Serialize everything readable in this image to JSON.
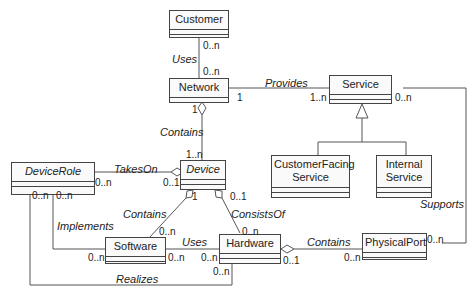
{
  "classes": {
    "customer": {
      "name": "Customer",
      "abstract": false
    },
    "network": {
      "name": "Network",
      "abstract": false
    },
    "service": {
      "name": "Service",
      "abstract": false
    },
    "customer_facing_service": {
      "name": "CustomerFacing Service",
      "line1": "CustomerFacing",
      "line2": "Service",
      "abstract": false
    },
    "internal_service": {
      "name": "Internal Service",
      "line1": "Internal",
      "line2": "Service",
      "abstract": false
    },
    "device_role": {
      "name": "DeviceRole",
      "abstract": true
    },
    "device": {
      "name": "Device",
      "abstract": true
    },
    "software": {
      "name": "Software",
      "abstract": false
    },
    "hardware": {
      "name": "Hardware",
      "abstract": false
    },
    "physical_port": {
      "name": "PhysicalPort",
      "abstract": false
    }
  },
  "associations": {
    "uses_customer_network": {
      "label": "Uses",
      "from_mult": "0..n",
      "to_mult": "0..n"
    },
    "provides": {
      "label": "Provides",
      "network_mult": "1",
      "service_mult": "1..n"
    },
    "contains_network_device": {
      "label": "Contains",
      "network_mult": "1",
      "device_mult": "1..n"
    },
    "takes_on": {
      "label": "TakesOn",
      "role_mult": "0..n",
      "device_mult": "0..1"
    },
    "contains_device_software": {
      "label": "Contains",
      "device_mult": "1",
      "software_mult": "0..n"
    },
    "consists_of": {
      "label": "ConsistsOf",
      "device_mult": "0..1",
      "hardware_mult": "0..n"
    },
    "implements": {
      "label": "Implements",
      "role_mult": "0..n",
      "software_mult": "0..n"
    },
    "uses_software_hardware": {
      "label": "Uses",
      "software_mult": "0..n",
      "hardware_mult": "0..n"
    },
    "contains_hardware_port": {
      "label": "Contains",
      "hardware_mult": "0..1",
      "port_mult": "0..n"
    },
    "realizes": {
      "label": "Realizes",
      "role_mult": "0..n",
      "hardware_mult": "0..n"
    },
    "supports": {
      "label": "Supports",
      "service_mult": "0..n",
      "port_mult": "0..n"
    }
  },
  "colors": {
    "line": "#555555",
    "box_border": "#444444",
    "box_fill": "#fafafa"
  }
}
